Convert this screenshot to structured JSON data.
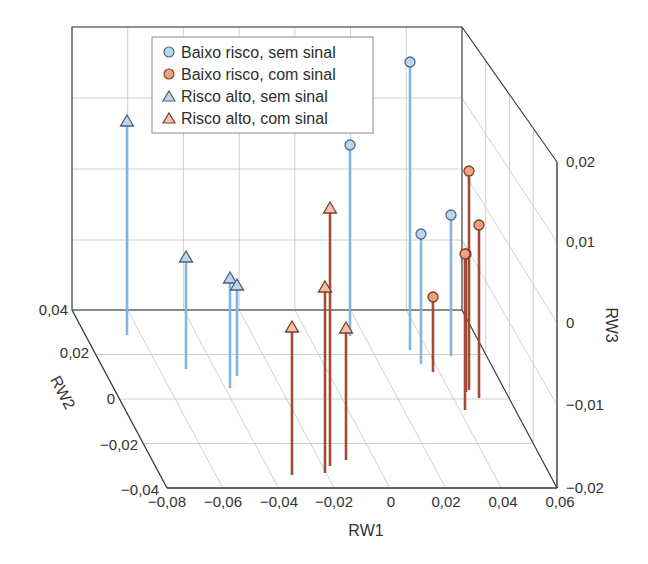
{
  "chart_data": {
    "type": "scatter3d-stem",
    "title": "",
    "xlabel": "RW1",
    "ylabel": "RW2",
    "zlabel": "RW3",
    "xlim": [
      -0.08,
      0.06
    ],
    "ylim": [
      -0.04,
      0.04
    ],
    "zlim": [
      -0.02,
      0.02
    ],
    "xticks": [
      "−0,08",
      "−0,06",
      "−0,04",
      "−0,02",
      "0",
      "0,02",
      "0,04",
      "0,06"
    ],
    "yticks": [
      "0,04",
      "0,02",
      "0",
      "−0,02",
      "−0,04"
    ],
    "zticks": [
      "0,02",
      "0,01",
      "0",
      "−0,01",
      "−0,02"
    ],
    "grid": true,
    "legend_position": "upper-left-inside",
    "series": [
      {
        "name": "Baixo risco, sem sinal",
        "marker": "circle",
        "fill": "#b9d8f0",
        "stem": "#7fb6e3",
        "points_px": [
          {
            "x": 350,
            "top": 145,
            "bottom": 336
          },
          {
            "x": 410,
            "top": 62,
            "bottom": 350
          },
          {
            "x": 421,
            "top": 234,
            "bottom": 364
          },
          {
            "x": 451,
            "top": 215,
            "bottom": 356
          }
        ]
      },
      {
        "name": "Baixo risco, com sinal",
        "marker": "circle",
        "fill": "#f2a07e",
        "stem": "#a24b36",
        "points_px": [
          {
            "x": 433,
            "top": 297,
            "bottom": 372
          },
          {
            "x": 469,
            "top": 171,
            "bottom": 390
          },
          {
            "x": 466,
            "top": 254,
            "bottom": 392
          },
          {
            "x": 479,
            "top": 225,
            "bottom": 398
          },
          {
            "x": 465,
            "top": 254,
            "bottom": 410
          }
        ]
      },
      {
        "name": "Risco alto, sem sinal",
        "marker": "triangle",
        "fill": "#b9d8f0",
        "stem": "#7fb6e3",
        "points_px": [
          {
            "x": 127,
            "top": 121,
            "bottom": 335
          },
          {
            "x": 186,
            "top": 257,
            "bottom": 369
          },
          {
            "x": 230,
            "top": 278,
            "bottom": 388
          },
          {
            "x": 237,
            "top": 285,
            "bottom": 376
          }
        ]
      },
      {
        "name": "Risco alto, com sinal",
        "marker": "triangle",
        "fill": "#f6c2aa",
        "stem": "#a24b36",
        "points_px": [
          {
            "x": 292,
            "top": 327,
            "bottom": 475
          },
          {
            "x": 325,
            "top": 287,
            "bottom": 473
          },
          {
            "x": 330,
            "top": 208,
            "bottom": 466
          },
          {
            "x": 346,
            "top": 328,
            "bottom": 460
          }
        ]
      }
    ]
  },
  "legend": {
    "items": [
      {
        "label": "Baixo risco, sem sinal",
        "marker": "circle",
        "fill": "#b9d8f0"
      },
      {
        "label": "Baixo risco, com sinal",
        "marker": "circle",
        "fill": "#f2a07e"
      },
      {
        "label": "Risco alto, sem sinal",
        "marker": "triangle",
        "fill": "#b9d8f0"
      },
      {
        "label": "Risco alto, com sinal",
        "marker": "triangle",
        "fill": "#f6c2aa"
      }
    ]
  },
  "axes": {
    "x": {
      "label": "RW1",
      "ticks": [
        "−0,08",
        "−0,06",
        "−0,04",
        "−0,02",
        "0",
        "0,02",
        "0,04",
        "0,06"
      ]
    },
    "y": {
      "label": "RW2",
      "ticks": [
        "0,04",
        "0,02",
        "0",
        "−0,02",
        "−0,04"
      ]
    },
    "z": {
      "label": "RW3",
      "ticks": [
        "0,02",
        "0,01",
        "0",
        "−0,01",
        "−0,02"
      ]
    }
  }
}
